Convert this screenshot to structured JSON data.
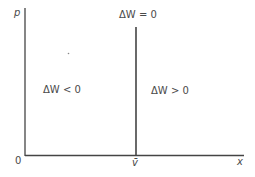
{
  "diagram": {
    "y_axis_label": "p",
    "x_axis_label": "x",
    "origin_label": "0",
    "threshold_label": "v̄",
    "boundary_label": "ΔW = 0",
    "left_region_label": "ΔW < 0",
    "right_region_label": "ΔW > 0"
  }
}
